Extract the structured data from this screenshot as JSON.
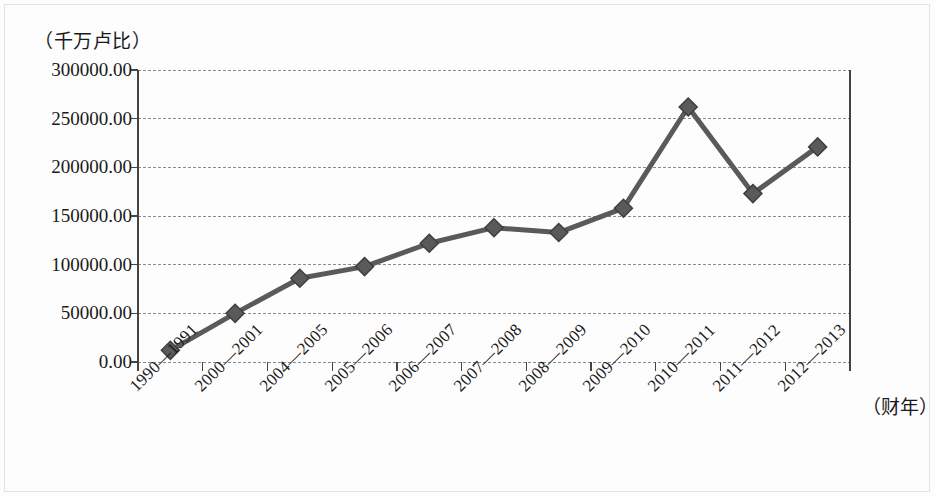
{
  "chart_data": {
    "type": "line",
    "title": "",
    "subtitle": "",
    "ylabel": "（千万卢比）",
    "xlabel": "（财年）",
    "categories": [
      "1990—1991",
      "2000—2001",
      "2004—2005",
      "2005—2006",
      "2006—2007",
      "2007—2008",
      "2008—2009",
      "2009—2010",
      "2010—2011",
      "2011—2012",
      "2012—2013"
    ],
    "values": [
      12000,
      50000,
      86000,
      98000,
      122000,
      138000,
      133000,
      158000,
      262000,
      173000,
      221000
    ],
    "ylim": [
      0,
      300000
    ],
    "ytick_labels": [
      "300000.00",
      "250000.00",
      "200000.00",
      "150000.00",
      "100000.00",
      "50000.00",
      "0.00"
    ],
    "ytick_values": [
      300000,
      250000,
      200000,
      150000,
      100000,
      50000,
      0
    ],
    "grid": true,
    "legend": "none",
    "series_color": "#5a5a5a",
    "marker": "diamond",
    "marker_color": "#5a5a5a",
    "grid_color": "#8c8c8c",
    "axis_color": "#444444"
  }
}
